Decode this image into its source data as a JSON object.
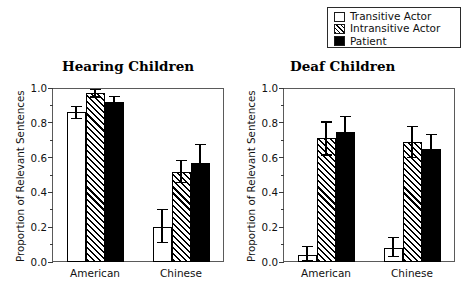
{
  "chart_data": {
    "type": "bar",
    "title": "",
    "ylabel": "Proportion of Relevant Sentences",
    "xlabel": "",
    "ylim": [
      0.0,
      1.0
    ],
    "ytick_labels": [
      "0.0",
      "0.2",
      "0.4",
      "0.6",
      "0.8",
      "1.0"
    ],
    "ytick_values": [
      0.0,
      0.2,
      0.4,
      0.6,
      0.8,
      1.0
    ],
    "minor_tick_step": 0.1,
    "grid": false,
    "legend_position": "top-right",
    "legend": [
      {
        "label": "Transitive Actor",
        "fill": "white"
      },
      {
        "label": "Intransitive Actor",
        "fill": "hatched"
      },
      {
        "label": "Patient",
        "fill": "black"
      }
    ],
    "categories": [
      "American",
      "Chinese"
    ],
    "panels": [
      {
        "title": "Hearing Children",
        "ylabel": "Proportion of Relevant Sentences",
        "groups": [
          {
            "category": "American",
            "bars": [
              {
                "series": "Transitive Actor",
                "value": 0.86,
                "err_low": 0.825,
                "err_high": 0.895
              },
              {
                "series": "Intransitive Actor",
                "value": 0.97,
                "err_low": 0.948,
                "err_high": 0.992
              },
              {
                "series": "Patient",
                "value": 0.92,
                "err_low": 0.888,
                "err_high": 0.952
              }
            ]
          },
          {
            "category": "Chinese",
            "bars": [
              {
                "series": "Transitive Actor",
                "value": 0.2,
                "err_low": 0.11,
                "err_high": 0.3
              },
              {
                "series": "Intransitive Actor",
                "value": 0.52,
                "err_low": 0.455,
                "err_high": 0.585
              },
              {
                "series": "Patient",
                "value": 0.57,
                "err_low": 0.48,
                "err_high": 0.675
              }
            ]
          }
        ]
      },
      {
        "title": "Deaf Children",
        "ylabel": "Proportion of Relevant Sentences",
        "groups": [
          {
            "category": "American",
            "bars": [
              {
                "series": "Transitive Actor",
                "value": 0.04,
                "err_low": 0.01,
                "err_high": 0.09
              },
              {
                "series": "Intransitive Actor",
                "value": 0.71,
                "err_low": 0.615,
                "err_high": 0.805
              },
              {
                "series": "Patient",
                "value": 0.75,
                "err_low": 0.665,
                "err_high": 0.835
              }
            ]
          },
          {
            "category": "Chinese",
            "bars": [
              {
                "series": "Transitive Actor",
                "value": 0.08,
                "err_low": 0.03,
                "err_high": 0.14
              },
              {
                "series": "Intransitive Actor",
                "value": 0.69,
                "err_low": 0.6,
                "err_high": 0.78
              },
              {
                "series": "Patient",
                "value": 0.65,
                "err_low": 0.565,
                "err_high": 0.735
              }
            ]
          }
        ]
      }
    ]
  },
  "colors": {
    "bar_outline": "#000000",
    "bar_white": "#ffffff",
    "bar_black": "#000000",
    "axis": "#5a5a5a",
    "text": "#111111"
  }
}
